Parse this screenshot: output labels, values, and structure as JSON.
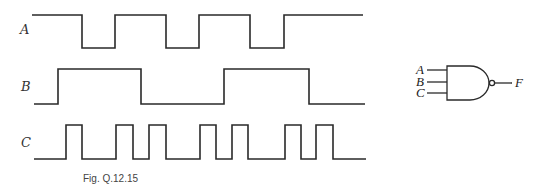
{
  "caption": "Fig. Q.12.15",
  "signals": [
    {
      "name": "A",
      "label_pos": [
        24,
        34
      ],
      "high_y": 15,
      "low_y": 48,
      "start_x": 32,
      "end_x": 363,
      "initial": 1,
      "transitions": [
        82,
        115,
        166,
        199,
        250,
        284
      ]
    },
    {
      "name": "B",
      "label_pos": [
        24,
        91
      ],
      "high_y": 69,
      "low_y": 104,
      "start_x": 34,
      "end_x": 365,
      "initial": 0,
      "transitions": [
        58,
        141,
        224,
        309
      ]
    },
    {
      "name": "C",
      "label_pos": [
        24,
        147
      ],
      "high_y": 125,
      "low_y": 159,
      "start_x": 34,
      "end_x": 366,
      "initial": 0,
      "transitions": [
        66,
        82,
        116,
        133,
        149,
        166,
        200,
        216,
        232,
        248,
        285,
        301,
        316,
        333
      ]
    }
  ],
  "gate": {
    "type": "NAND",
    "inputs": [
      {
        "label": "A",
        "y": 70
      },
      {
        "label": "B",
        "y": 82
      },
      {
        "label": "C",
        "y": 93
      }
    ],
    "output": {
      "label": "F",
      "y": 81
    }
  },
  "colors": {
    "stroke": "#2a2a2a",
    "background": "#ffffff"
  }
}
